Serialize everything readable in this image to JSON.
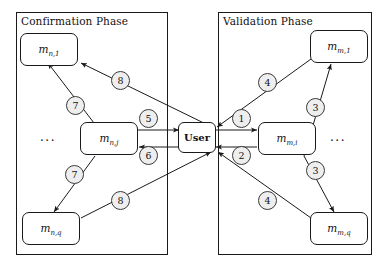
{
  "diagram": {
    "width": 387,
    "height": 272,
    "colors": {
      "stroke": "#1a1a1a",
      "badge_fill": "#eeeeee",
      "badge_stroke": "#3a3a3a",
      "background": "#ffffff"
    }
  },
  "phases": [
    {
      "id": "confirmation",
      "title": "Confirmation Phase",
      "box": {
        "x": 16,
        "y": 12,
        "w": 152,
        "h": 243
      },
      "title_pos": {
        "x": 21,
        "y": 15
      },
      "ellipsis": "...",
      "ellipsis_pos": {
        "x": 40,
        "y": 132
      }
    },
    {
      "id": "validation",
      "title": "Validation Phase",
      "box": {
        "x": 218,
        "y": 12,
        "w": 154,
        "h": 243
      },
      "title_pos": {
        "x": 223,
        "y": 15
      },
      "ellipsis": "...",
      "ellipsis_pos": {
        "x": 330,
        "y": 132
      }
    }
  ],
  "nodes": [
    {
      "id": "m_n_1",
      "base": "m",
      "sub": "n,1",
      "x": 20,
      "y": 33,
      "w": 58,
      "h": 33
    },
    {
      "id": "m_n_j",
      "base": "m",
      "sub": "n,j",
      "x": 80,
      "y": 122,
      "w": 58,
      "h": 33
    },
    {
      "id": "m_n_q",
      "base": "m",
      "sub": "n,q",
      "x": 22,
      "y": 212,
      "w": 58,
      "h": 33
    },
    {
      "id": "m_m_1",
      "base": "m",
      "sub": "m,1",
      "x": 310,
      "y": 30,
      "w": 58,
      "h": 33
    },
    {
      "id": "m_m_i",
      "base": "m",
      "sub": "m,i",
      "x": 258,
      "y": 122,
      "w": 58,
      "h": 33
    },
    {
      "id": "m_m_q",
      "base": "m",
      "sub": "m,q",
      "x": 310,
      "y": 212,
      "w": 58,
      "h": 33
    }
  ],
  "user_node": {
    "id": "user",
    "label": "User",
    "x": 178,
    "y": 122,
    "w": 38,
    "h": 31
  },
  "step_badges": [
    {
      "id": "badge-8-top",
      "label": "8",
      "x": 111,
      "y": 71,
      "phase": "confirmation"
    },
    {
      "id": "badge-7-top",
      "label": "7",
      "x": 66,
      "y": 96,
      "phase": "confirmation"
    },
    {
      "id": "badge-5",
      "label": "5",
      "x": 139,
      "y": 109,
      "phase": "confirmation"
    },
    {
      "id": "badge-6",
      "label": "6",
      "x": 139,
      "y": 146,
      "phase": "confirmation"
    },
    {
      "id": "badge-7-bottom",
      "label": "7",
      "x": 65,
      "y": 165,
      "phase": "confirmation"
    },
    {
      "id": "badge-8-bottom",
      "label": "8",
      "x": 111,
      "y": 191,
      "phase": "confirmation"
    },
    {
      "id": "badge-4-top",
      "label": "4",
      "x": 258,
      "y": 73,
      "phase": "validation"
    },
    {
      "id": "badge-3-top",
      "label": "3",
      "x": 306,
      "y": 98,
      "phase": "validation"
    },
    {
      "id": "badge-1",
      "label": "1",
      "x": 232,
      "y": 109,
      "phase": "validation"
    },
    {
      "id": "badge-2",
      "label": "2",
      "x": 232,
      "y": 146,
      "phase": "validation"
    },
    {
      "id": "badge-3-bottom",
      "label": "3",
      "x": 306,
      "y": 161,
      "phase": "validation"
    },
    {
      "id": "badge-4-bottom",
      "label": "4",
      "x": 258,
      "y": 191,
      "phase": "validation"
    }
  ],
  "edges": [
    {
      "id": "edge-user-to-m_n_1",
      "from": "user",
      "to": "m_n_1",
      "badge": "8",
      "x1": 214,
      "y1": 128,
      "x2": 80,
      "y2": 64,
      "arrow_at": "to"
    },
    {
      "id": "edge-m_n_1-to-m_n_j",
      "from": "m_n_1",
      "to": "m_n_j",
      "badge": "7",
      "x1": 50,
      "y1": 66,
      "x2": 93,
      "y2": 124,
      "arrow_at": "from"
    },
    {
      "id": "edge-m_n_j-to-user",
      "from": "m_n_j",
      "to": "user",
      "badge": "5",
      "x1": 138,
      "y1": 131,
      "x2": 178,
      "y2": 131,
      "arrow_at": "to"
    },
    {
      "id": "edge-user-to-m_n_j",
      "from": "user",
      "to": "m_n_j",
      "badge": "6",
      "x1": 178,
      "y1": 146,
      "x2": 138,
      "y2": 146,
      "arrow_at": "to"
    },
    {
      "id": "edge-m_n_j-to-m_n_q",
      "from": "m_n_j",
      "to": "m_n_q",
      "badge": "7",
      "x1": 93,
      "y1": 155,
      "x2": 52,
      "y2": 212,
      "arrow_at": "to"
    },
    {
      "id": "edge-m_n_q-to-user",
      "from": "m_n_q",
      "to": "user",
      "badge": "8",
      "x1": 80,
      "y1": 219,
      "x2": 212,
      "y2": 153,
      "arrow_at": "to"
    },
    {
      "id": "edge-m_m_1-to-user",
      "from": "m_m_1",
      "to": "user",
      "badge": "4",
      "x1": 310,
      "y1": 60,
      "x2": 216,
      "y2": 128,
      "arrow_at": "to"
    },
    {
      "id": "edge-m_m_i-to-m_m_1",
      "from": "m_m_i",
      "to": "m_m_1",
      "badge": "3",
      "x1": 303,
      "y1": 122,
      "x2": 330,
      "y2": 63,
      "arrow_at": "to"
    },
    {
      "id": "edge-user-to-m_m_i",
      "from": "user",
      "to": "m_m_i",
      "badge": "1",
      "x1": 216,
      "y1": 131,
      "x2": 258,
      "y2": 131,
      "arrow_at": "to"
    },
    {
      "id": "edge-m_m_i-to-user",
      "from": "m_m_i",
      "to": "user",
      "badge": "2",
      "x1": 258,
      "y1": 146,
      "x2": 216,
      "y2": 146,
      "arrow_at": "to"
    },
    {
      "id": "edge-m_m_i-to-m_m_q",
      "from": "m_m_i",
      "to": "m_m_q",
      "badge": "3",
      "x1": 303,
      "y1": 155,
      "x2": 333,
      "y2": 212,
      "arrow_at": "to"
    },
    {
      "id": "edge-m_m_q-to-user",
      "from": "m_m_q",
      "to": "user",
      "badge": "4",
      "x1": 310,
      "y1": 219,
      "x2": 218,
      "y2": 153,
      "arrow_at": "from"
    }
  ]
}
